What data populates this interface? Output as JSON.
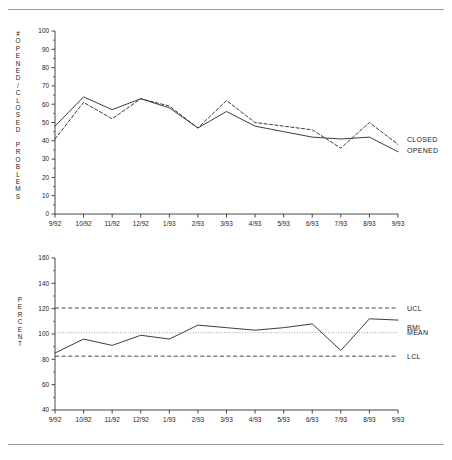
{
  "figure": {
    "top_rule": "horizontal-rule",
    "bottom_rule": "horizontal-rule"
  },
  "chart_data": [
    {
      "id": "opened-closed-problems",
      "type": "line",
      "title": "",
      "xlabel": "",
      "ylabel": "# OPENED / CLOSED PROBLEMS",
      "ylabel_lines": [
        "#",
        "O",
        "P",
        "E",
        "N",
        "E",
        "D",
        "/",
        "C",
        "L",
        "O",
        "S",
        "E",
        "D",
        "",
        "P",
        "R",
        "O",
        "B",
        "L",
        "E",
        "M",
        "S"
      ],
      "x": [
        "9/92",
        "10/92",
        "11/92",
        "12/92",
        "1/93",
        "2/93",
        "3/93",
        "4/93",
        "5/93",
        "6/93",
        "7/93",
        "8/93",
        "9/93"
      ],
      "ylim": [
        0,
        100
      ],
      "yticks": [
        0,
        10,
        20,
        30,
        40,
        50,
        60,
        70,
        80,
        90,
        100
      ],
      "grid": false,
      "legend_position": "right-of-plot",
      "series": [
        {
          "name": "CLOSED",
          "style": "dashed",
          "color": "#333333",
          "values": [
            41,
            61,
            52,
            63,
            59,
            47,
            62,
            50,
            48,
            46,
            36,
            50,
            38
          ]
        },
        {
          "name": "OPENED",
          "style": "solid",
          "color": "#333333",
          "values": [
            48,
            64,
            57,
            63,
            58,
            47,
            56,
            48,
            45,
            42,
            41,
            42,
            34
          ]
        }
      ]
    },
    {
      "id": "percent-bmi-control-chart",
      "type": "line",
      "title": "",
      "xlabel": "",
      "ylabel": "PERCENT",
      "ylabel_lines": [
        "P",
        "E",
        "R",
        "C",
        "E",
        "N",
        "T"
      ],
      "x": [
        "9/92",
        "10/92",
        "11/92",
        "12/92",
        "1/93",
        "2/93",
        "3/93",
        "4/93",
        "5/93",
        "6/93",
        "7/93",
        "8/93",
        "9/93"
      ],
      "ylim": [
        40,
        160
      ],
      "yticks": [
        40,
        60,
        80,
        100,
        120,
        140,
        160
      ],
      "grid": false,
      "legend_position": "right-of-plot",
      "series": [
        {
          "name": "BMI",
          "style": "solid",
          "color": "#333333",
          "values": [
            85,
            96,
            91,
            99,
            96,
            107,
            105,
            103,
            105,
            108,
            87,
            112,
            111
          ]
        }
      ],
      "reference_lines": [
        {
          "name": "UCL",
          "value": 120.5,
          "style": "dashed",
          "color": "#333333"
        },
        {
          "name": "MEAN",
          "value": 101,
          "style": "dotted",
          "color": "#888888"
        },
        {
          "name": "LCL",
          "value": 82.5,
          "style": "dashed",
          "color": "#333333"
        }
      ]
    }
  ]
}
